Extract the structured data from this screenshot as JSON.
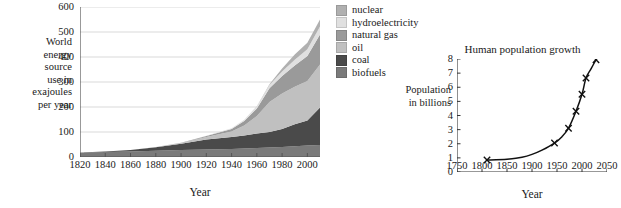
{
  "chart_data": [
    {
      "id": "world-energy",
      "type": "area",
      "stacked": true,
      "title": "",
      "xlabel": "Year",
      "ylabel": "World energy source use in exajoules per year",
      "ylabel_lines": [
        "World",
        "energy",
        "source",
        "use  in",
        "exajoules",
        "per year"
      ],
      "xlim": [
        1820,
        2010
      ],
      "ylim": [
        0,
        600
      ],
      "xticks": [
        1820,
        1840,
        1860,
        1880,
        1900,
        1920,
        1940,
        1960,
        1980,
        2000
      ],
      "yticks": [
        0,
        100,
        200,
        300,
        400,
        500,
        600
      ],
      "grid": "horizontal",
      "legend_position": "right",
      "x": [
        1820,
        1840,
        1860,
        1880,
        1900,
        1920,
        1940,
        1950,
        1960,
        1970,
        1980,
        1990,
        2000,
        2010
      ],
      "series": [
        {
          "name": "biofuels",
          "color": "#7a7a7a",
          "values": [
            18,
            20,
            22,
            25,
            28,
            30,
            32,
            34,
            36,
            38,
            40,
            43,
            46,
            48
          ]
        },
        {
          "name": "coal",
          "color": "#4a4a4a",
          "values": [
            0,
            2,
            6,
            14,
            25,
            40,
            48,
            52,
            58,
            62,
            72,
            88,
            100,
            150
          ]
        },
        {
          "name": "oil",
          "color": "#c0c0c0",
          "values": [
            0,
            0,
            0,
            1,
            3,
            10,
            22,
            40,
            70,
            120,
            142,
            150,
            158,
            172
          ]
        },
        {
          "name": "natural gas",
          "color": "#9a9a9a",
          "values": [
            0,
            0,
            0,
            0,
            1,
            4,
            10,
            18,
            30,
            55,
            70,
            85,
            100,
            120
          ]
        },
        {
          "name": "hydroelectricity",
          "color": "#e0e0e0",
          "values": [
            0,
            0,
            0,
            0,
            0,
            1,
            3,
            5,
            8,
            13,
            18,
            23,
            27,
            32
          ]
        },
        {
          "name": "nuclear",
          "color": "#b0b0b0",
          "values": [
            0,
            0,
            0,
            0,
            0,
            0,
            0,
            0,
            1,
            3,
            12,
            21,
            26,
            28
          ]
        }
      ],
      "legend": [
        {
          "label": "nuclear",
          "color": "#b0b0b0"
        },
        {
          "label": "hydroelectricity",
          "color": "#e0e0e0"
        },
        {
          "label": "natural gas",
          "color": "#9a9a9a"
        },
        {
          "label": "oil",
          "color": "#c0c0c0"
        },
        {
          "label": "coal",
          "color": "#4a4a4a"
        },
        {
          "label": "biofuels",
          "color": "#7a7a7a"
        }
      ]
    },
    {
      "id": "human-population-growth",
      "type": "line",
      "title": "Human population growth",
      "xlabel": "Year",
      "ylabel": "Population in billions",
      "ylabel_lines": [
        "Population",
        "in billions"
      ],
      "xlim": [
        1750,
        2050
      ],
      "ylim": [
        0,
        8
      ],
      "xticks": [
        1750,
        1800,
        1850,
        1900,
        1950,
        2000,
        2050
      ],
      "yticks": [
        0,
        1,
        2,
        3,
        4,
        5,
        6,
        7,
        8
      ],
      "grid": "none",
      "marker": "x",
      "points": [
        {
          "x": 1810,
          "y": 0.85
        },
        {
          "x": 1945,
          "y": 2.05
        },
        {
          "x": 1973,
          "y": 3.1
        },
        {
          "x": 1988,
          "y": 4.3
        },
        {
          "x": 2000,
          "y": 5.5
        },
        {
          "x": 2008,
          "y": 6.65
        },
        {
          "x": 2028,
          "y": 7.95
        }
      ],
      "curve": [
        {
          "x": 1810,
          "y": 0.85
        },
        {
          "x": 1850,
          "y": 0.9
        },
        {
          "x": 1880,
          "y": 1.05
        },
        {
          "x": 1900,
          "y": 1.25
        },
        {
          "x": 1920,
          "y": 1.55
        },
        {
          "x": 1945,
          "y": 2.05
        },
        {
          "x": 1960,
          "y": 2.5
        },
        {
          "x": 1973,
          "y": 3.1
        },
        {
          "x": 1988,
          "y": 4.3
        },
        {
          "x": 2000,
          "y": 5.5
        },
        {
          "x": 2008,
          "y": 6.65
        },
        {
          "x": 2018,
          "y": 7.3
        },
        {
          "x": 2028,
          "y": 7.95
        }
      ],
      "line_color": "#111111"
    }
  ],
  "style": {
    "axis_color": "#555555",
    "grid_color": "#c8c8c8",
    "background": "#ffffff",
    "text_color": "#1a1a1a"
  }
}
